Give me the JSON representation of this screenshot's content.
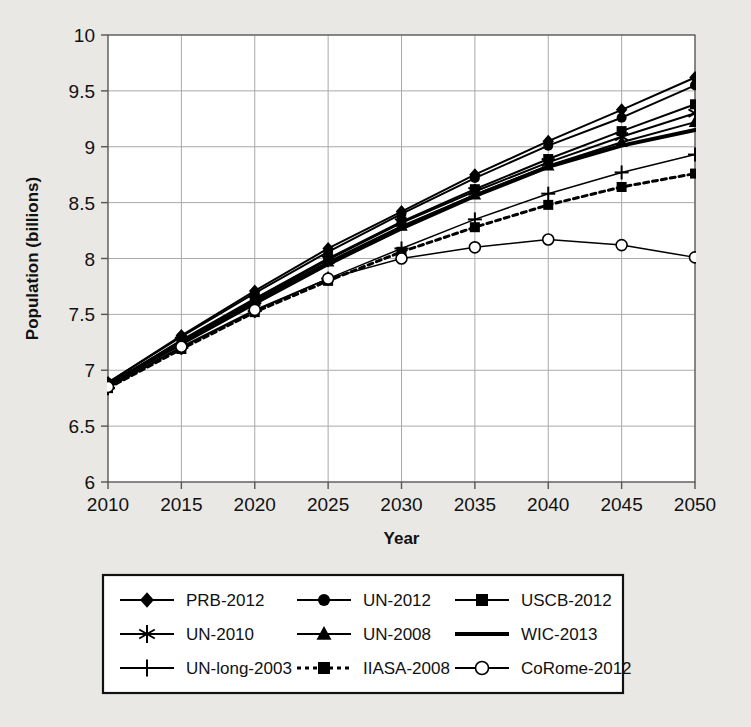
{
  "chart_data": {
    "type": "line",
    "title": "",
    "xlabel": "Year",
    "ylabel": "Population (billions)",
    "x": [
      2010,
      2015,
      2020,
      2025,
      2030,
      2035,
      2040,
      2045,
      2050
    ],
    "xlim": [
      2010,
      2050
    ],
    "ylim": [
      6,
      10
    ],
    "xticks": [
      "2010",
      "2015",
      "2020",
      "2025",
      "2030",
      "2035",
      "2040",
      "2045",
      "2050"
    ],
    "yticks": [
      "6",
      "6.5",
      "7",
      "7.5",
      "8",
      "8.5",
      "9",
      "9.5",
      "10"
    ],
    "grid": true,
    "legend_position": "bottom",
    "series": [
      {
        "name": "PRB-2012",
        "marker": "diamond",
        "linestyle": "solid",
        "linewidth": 2,
        "values": [
          6.89,
          7.31,
          7.71,
          8.09,
          8.42,
          8.75,
          9.05,
          9.33,
          9.62
        ]
      },
      {
        "name": "UN-2012",
        "marker": "circle",
        "linestyle": "solid",
        "linewidth": 2,
        "values": [
          6.89,
          7.3,
          7.69,
          8.06,
          8.4,
          8.72,
          9.01,
          9.26,
          9.55
        ]
      },
      {
        "name": "USCB-2012",
        "marker": "square",
        "linestyle": "solid",
        "linewidth": 2,
        "values": [
          6.87,
          7.27,
          7.64,
          8.0,
          8.33,
          8.62,
          8.89,
          9.14,
          9.38
        ]
      },
      {
        "name": "UN-2010",
        "marker": "asterisk",
        "linestyle": "solid",
        "linewidth": 2,
        "values": [
          6.87,
          7.26,
          7.63,
          7.99,
          8.32,
          8.6,
          8.86,
          9.09,
          9.3
        ]
      },
      {
        "name": "UN-2008",
        "marker": "triangle",
        "linestyle": "solid",
        "linewidth": 2,
        "values": [
          6.87,
          7.25,
          7.62,
          7.97,
          8.29,
          8.57,
          8.83,
          9.04,
          9.22
        ]
      },
      {
        "name": "WIC-2013",
        "marker": "none",
        "linestyle": "solid",
        "linewidth": 4,
        "values": [
          6.87,
          7.24,
          7.6,
          7.95,
          8.27,
          8.56,
          8.82,
          9.01,
          9.15
        ]
      },
      {
        "name": "UN-long-2003",
        "marker": "plus",
        "linestyle": "solid",
        "linewidth": 1.5,
        "values": [
          6.84,
          7.2,
          7.53,
          7.82,
          8.09,
          8.35,
          8.58,
          8.77,
          8.93
        ]
      },
      {
        "name": "IIASA-2008",
        "marker": "square",
        "linestyle": "dotted",
        "linewidth": 3,
        "values": [
          6.84,
          7.19,
          7.52,
          7.8,
          8.06,
          8.28,
          8.48,
          8.64,
          8.76
        ]
      },
      {
        "name": "CoRome-2012",
        "marker": "open-circle",
        "linestyle": "solid",
        "linewidth": 1.5,
        "values": [
          6.85,
          7.21,
          7.54,
          7.82,
          8.0,
          8.1,
          8.17,
          8.12,
          8.01
        ]
      }
    ]
  },
  "legend": {
    "rows": [
      [
        "PRB-2012",
        "UN-2012",
        "USCB-2012"
      ],
      [
        "UN-2010",
        "UN-2008",
        "WIC-2013"
      ],
      [
        "UN-long-2003",
        "IIASA-2008",
        "CoRome-2012"
      ]
    ]
  },
  "colors": {
    "background": "#e9e8e5",
    "plot_background": "#ffffff",
    "line": "#000000",
    "grid": "#a9a9a9",
    "axis": "#555555",
    "border": "#111111"
  }
}
